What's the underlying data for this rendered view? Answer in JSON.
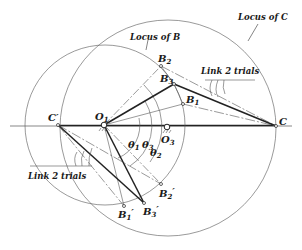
{
  "diagram": {
    "colors": {
      "line": "#333333",
      "thin": "#555555",
      "bg": "#ffffff"
    },
    "loci": [
      {
        "name": "Locus of B",
        "label": "Locus of B",
        "center": "O1",
        "cx": 105,
        "cy": 125,
        "r": 80
      },
      {
        "name": "Locus of C",
        "label": "Locus of C",
        "center": "O3",
        "cx": 168,
        "cy": 128,
        "r": 108
      }
    ],
    "points": {
      "C_prime": {
        "label": "C",
        "prime": "′",
        "x": 58,
        "y": 125
      },
      "O1": {
        "label": "O",
        "sub": "1",
        "x": 104,
        "y": 125
      },
      "O3": {
        "label": "O",
        "sub": "3",
        "x": 167,
        "y": 127
      },
      "C": {
        "label": "C",
        "x": 276,
        "y": 126
      },
      "B1": {
        "label": "B",
        "sub": "1",
        "x": 183,
        "y": 104
      },
      "B2": {
        "label": "B",
        "sub": "2",
        "x": 161,
        "y": 66
      },
      "B3": {
        "label": "B",
        "sub": "3",
        "x": 174,
        "y": 84
      },
      "B1_prime": {
        "label": "B",
        "sub": "1",
        "prime": "′",
        "x": 124,
        "y": 206
      },
      "B2_prime": {
        "label": "B",
        "sub": "2",
        "prime": "′",
        "x": 161,
        "y": 184
      },
      "B3_prime": {
        "label": "B",
        "sub": "3",
        "prime": "′",
        "x": 144,
        "y": 203
      }
    },
    "angles": [
      {
        "label": "θ",
        "sub": "1"
      },
      {
        "label": "θ",
        "sub": "2"
      },
      {
        "label": "θ",
        "sub": "3"
      }
    ],
    "annotations": {
      "locus_b": "Locus of B",
      "locus_c": "Locus of C",
      "link2_trials_upper": "Link 2 trials",
      "link2_trials_lower": "Link 2 trials"
    }
  }
}
